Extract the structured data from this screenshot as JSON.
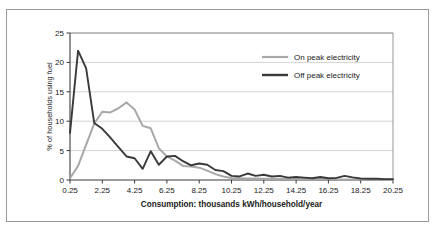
{
  "chart_data": {
    "type": "line",
    "title": "",
    "subtitle": "",
    "xlabel": "Consumption: thousands kWh/household/year",
    "ylabel": "% of households using fuel",
    "xlim": [
      0.25,
      20.25
    ],
    "ylim": [
      0,
      25
    ],
    "xticks": [
      "0.25",
      "2.25",
      "4.25",
      "6.25",
      "8.25",
      "10.25",
      "12.25",
      "14.25",
      "16.25",
      "18.25",
      "20.25"
    ],
    "xtick_values": [
      0.25,
      2.25,
      4.25,
      6.25,
      8.25,
      10.25,
      12.25,
      14.25,
      16.25,
      18.25,
      20.25
    ],
    "yticks": [
      "0",
      "5",
      "10",
      "15",
      "20",
      "25"
    ],
    "ytick_values": [
      0,
      5,
      10,
      15,
      20,
      25
    ],
    "grid": "horizontal",
    "legend_position": "upper-right-inside",
    "series": [
      {
        "name": "On peak electricity",
        "color": "#a8a8a8",
        "x": [
          0.25,
          0.75,
          1.25,
          1.75,
          2.25,
          2.75,
          3.25,
          3.75,
          4.25,
          4.75,
          5.25,
          5.75,
          6.25,
          6.75,
          7.25,
          7.75,
          8.25,
          8.75,
          9.25,
          9.75,
          10.25,
          10.75,
          11.25,
          11.75,
          12.25,
          12.75,
          13.25,
          13.75,
          14.25,
          14.75,
          15.25,
          15.75,
          16.25,
          16.75,
          17.25,
          17.75,
          18.25,
          18.75,
          19.25,
          19.75,
          20.25
        ],
        "values": [
          0.3,
          2.4,
          6.0,
          9.6,
          11.6,
          11.5,
          12.2,
          13.2,
          12.0,
          9.2,
          8.8,
          5.4,
          4.0,
          3.3,
          2.4,
          2.3,
          2.1,
          1.6,
          1.0,
          0.6,
          0.35,
          0.3,
          0.25,
          0.25,
          0.2,
          0.2,
          0.2,
          0.2,
          0.15,
          0.15,
          0.15,
          0.15,
          0.15,
          0.1,
          0.1,
          0.1,
          0.1,
          0.1,
          0.1,
          0.1,
          0.1
        ]
      },
      {
        "name": "Off peak electricity",
        "color": "#3a3a3a",
        "x": [
          0.25,
          0.75,
          1.25,
          1.75,
          2.25,
          2.75,
          3.25,
          3.75,
          4.25,
          4.75,
          5.25,
          5.75,
          6.25,
          6.75,
          7.25,
          7.75,
          8.25,
          8.75,
          9.25,
          9.75,
          10.25,
          10.75,
          11.25,
          11.75,
          12.25,
          12.75,
          13.25,
          13.75,
          14.25,
          14.75,
          15.25,
          15.75,
          16.25,
          16.75,
          17.25,
          17.75,
          18.25,
          18.75,
          19.25,
          19.75,
          20.25
        ],
        "values": [
          8.0,
          22.0,
          19.0,
          9.7,
          8.7,
          7.2,
          5.6,
          4.0,
          3.7,
          1.9,
          4.9,
          2.6,
          4.0,
          4.1,
          3.2,
          2.5,
          2.8,
          2.6,
          1.7,
          1.5,
          0.7,
          0.6,
          1.1,
          0.7,
          0.9,
          0.6,
          0.7,
          0.4,
          0.5,
          0.4,
          0.3,
          0.5,
          0.3,
          0.35,
          0.7,
          0.45,
          0.25,
          0.2,
          0.2,
          0.15,
          0.15
        ]
      }
    ]
  },
  "legend": {
    "items": [
      {
        "label": "On peak electricity",
        "color": "#a8a8a8"
      },
      {
        "label": "Off peak electricity",
        "color": "#3a3a3a"
      }
    ]
  },
  "axes": {
    "x_title": "Consumption: thousands kWh/household/year",
    "y_title": "% of households using fuel"
  }
}
